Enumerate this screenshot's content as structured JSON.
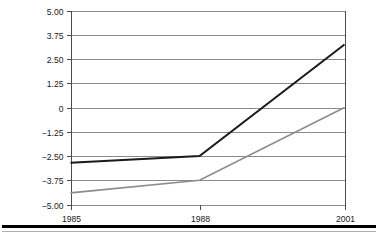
{
  "chart_data": {
    "type": "line",
    "title": "",
    "subtitle": "",
    "xlabel": "",
    "ylabel": "",
    "x": [
      "1985",
      "1988",
      "2001"
    ],
    "categories": [
      "1985",
      "1988",
      "2001"
    ],
    "x_positions_pct": [
      0,
      47.1,
      100
    ],
    "ylim": [
      -5.0,
      5.0
    ],
    "yticks": [
      5.0,
      3.75,
      2.5,
      1.25,
      0,
      -1.25,
      -2.5,
      -3.75,
      -5.0
    ],
    "ytick_labels": [
      "5.00",
      "3.75",
      "2.50",
      "1.25",
      "0",
      "−1.25",
      "−2.50",
      "−3.75",
      "−5.00"
    ],
    "xtick_labels": [
      "1985",
      "1988",
      "2001"
    ],
    "grid": true,
    "grid_color": "#8a8a8a",
    "legend": false,
    "legend_position": "none",
    "axis_color": "#4d4d4d",
    "background": "#ffffff",
    "series": [
      {
        "name": "series-black",
        "color": "#1a1a1a",
        "width": 2.0,
        "values": [
          -2.85,
          -2.5,
          3.25
        ]
      },
      {
        "name": "series-gray",
        "color": "#8c8c8c",
        "width": 1.6,
        "values": [
          -4.4,
          -3.75,
          0
        ]
      }
    ],
    "annotations": []
  },
  "figure": {
    "bottom_rule_color": "#000000"
  }
}
